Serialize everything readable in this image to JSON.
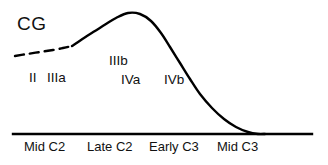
{
  "figure": {
    "background_color": "#ffffff",
    "stroke_color": "#000000",
    "series_label": "CG",
    "series_label_x": 17,
    "series_label_y": 14
  },
  "axis": {
    "baseline_y": 134,
    "baseline_x_start": 13,
    "baseline_x_end": 312,
    "tick_labels": [
      {
        "text": "Mid C2",
        "x": 24,
        "y": 140
      },
      {
        "text": "Late C2",
        "x": 87,
        "y": 140
      },
      {
        "text": "Early C3",
        "x": 149,
        "y": 140
      },
      {
        "text": "Mid C3",
        "x": 217,
        "y": 140
      }
    ]
  },
  "stage_labels": [
    {
      "text": "II",
      "x": 29,
      "y": 71
    },
    {
      "text": "IIIa",
      "x": 47,
      "y": 71
    },
    {
      "text": "IIIb",
      "x": 109,
      "y": 54
    },
    {
      "text": "IVa",
      "x": 121,
      "y": 73
    },
    {
      "text": "IVb",
      "x": 164,
      "y": 73
    }
  ],
  "chart_data": {
    "type": "line",
    "title": "",
    "xlabel": "",
    "ylabel": "",
    "grid": false,
    "legend": "inline",
    "series": [
      {
        "name": "CG",
        "style": "dashed",
        "note": "inferred / extrapolated early portion",
        "points": [
          [
            15,
            56
          ],
          [
            27,
            54
          ],
          [
            40,
            52
          ],
          [
            53,
            50
          ],
          [
            63,
            48
          ],
          [
            72,
            46
          ]
        ]
      },
      {
        "name": "CG",
        "style": "solid",
        "note": "observed portion: rise to peak then decline to baseline",
        "points": [
          [
            72,
            46
          ],
          [
            84,
            38
          ],
          [
            95,
            31
          ],
          [
            106,
            24
          ],
          [
            116,
            18
          ],
          [
            128,
            13
          ],
          [
            140,
            14
          ],
          [
            151,
            21
          ],
          [
            161,
            33
          ],
          [
            170,
            47
          ],
          [
            180,
            63
          ],
          [
            190,
            79
          ],
          [
            200,
            94
          ],
          [
            212,
            108
          ],
          [
            224,
            119
          ],
          [
            236,
            127
          ],
          [
            248,
            132
          ],
          [
            258,
            134
          ],
          [
            265,
            134
          ]
        ]
      }
    ],
    "categories": [
      "Mid C2",
      "Late C2",
      "Early C3",
      "Mid C3"
    ],
    "stages": [
      "II",
      "IIIa",
      "IIIb",
      "IVa",
      "IVb"
    ]
  }
}
